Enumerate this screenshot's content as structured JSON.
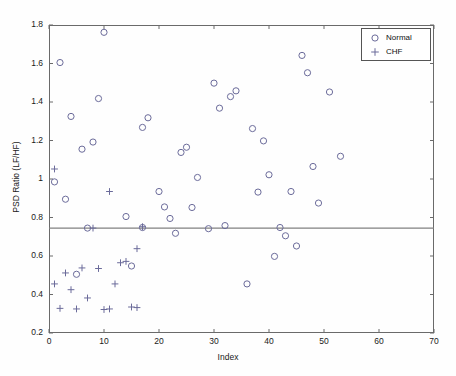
{
  "chart_data": {
    "type": "scatter",
    "title": "",
    "xlabel": "Index",
    "ylabel": "PSD Ratio (LF/HF)",
    "xlim": [
      0,
      70
    ],
    "ylim": [
      0.2,
      1.8
    ],
    "xticks": [
      0,
      10,
      20,
      30,
      40,
      50,
      60,
      70
    ],
    "yticks": [
      0.2,
      0.4,
      0.6,
      0.8,
      1,
      1.2,
      1.4,
      1.6,
      1.8
    ],
    "xtick_labels": [
      "0",
      "10",
      "20",
      "30",
      "40",
      "50",
      "60",
      "70"
    ],
    "ytick_labels": [
      "0.2",
      "0.4",
      "0.6",
      "0.8",
      "1",
      "1.2",
      "1.4",
      "1.6",
      "1.8"
    ],
    "grid": false,
    "legend_position": "upper right",
    "threshold_line": {
      "orientation": "horizontal",
      "value": 0.745,
      "color": "#808080",
      "label": ""
    },
    "series": [
      {
        "name": "Normal",
        "marker": "circle",
        "color": "#6b6b9a",
        "points": [
          [
            1,
            0.985
          ],
          [
            2,
            1.605
          ],
          [
            3,
            0.895
          ],
          [
            4,
            1.325
          ],
          [
            5,
            0.505
          ],
          [
            6,
            1.155
          ],
          [
            7,
            0.745
          ],
          [
            8,
            1.192
          ],
          [
            9,
            1.418
          ],
          [
            10,
            1.762
          ],
          [
            14,
            0.805
          ],
          [
            15,
            0.548
          ],
          [
            17,
            1.268
          ],
          [
            17,
            0.748
          ],
          [
            18,
            1.318
          ],
          [
            20,
            0.935
          ],
          [
            21,
            0.855
          ],
          [
            22,
            0.795
          ],
          [
            23,
            0.718
          ],
          [
            24,
            1.138
          ],
          [
            25,
            1.165
          ],
          [
            26,
            0.852
          ],
          [
            27,
            1.008
          ],
          [
            29,
            0.742
          ],
          [
            30,
            1.498
          ],
          [
            31,
            1.368
          ],
          [
            32,
            0.758
          ],
          [
            33,
            1.428
          ],
          [
            34,
            1.458
          ],
          [
            36,
            0.455
          ],
          [
            37,
            1.262
          ],
          [
            38,
            0.932
          ],
          [
            39,
            1.198
          ],
          [
            40,
            1.022
          ],
          [
            41,
            0.598
          ],
          [
            42,
            0.748
          ],
          [
            43,
            0.705
          ],
          [
            44,
            0.935
          ],
          [
            45,
            0.652
          ],
          [
            46,
            1.642
          ],
          [
            47,
            1.552
          ],
          [
            48,
            1.065
          ],
          [
            49,
            0.875
          ],
          [
            51,
            1.452
          ],
          [
            53,
            1.118
          ]
        ]
      },
      {
        "name": "CHF",
        "marker": "plus",
        "color": "#6b6b9a",
        "points": [
          [
            1,
            1.052
          ],
          [
            1,
            0.455
          ],
          [
            2,
            0.328
          ],
          [
            3,
            0.512
          ],
          [
            4,
            0.425
          ],
          [
            5,
            0.325
          ],
          [
            6,
            0.538
          ],
          [
            7,
            0.382
          ],
          [
            8,
            0.745
          ],
          [
            9,
            0.535
          ],
          [
            10,
            0.322
          ],
          [
            11,
            0.325
          ],
          [
            11,
            0.935
          ],
          [
            12,
            0.455
          ],
          [
            13,
            0.565
          ],
          [
            14,
            0.572
          ],
          [
            15,
            0.335
          ],
          [
            16,
            0.332
          ],
          [
            16,
            0.638
          ],
          [
            17,
            0.752
          ]
        ]
      }
    ]
  },
  "legend": {
    "entries": [
      {
        "label": "Normal",
        "marker": "circle"
      },
      {
        "label": "CHF",
        "marker": "plus"
      }
    ]
  }
}
